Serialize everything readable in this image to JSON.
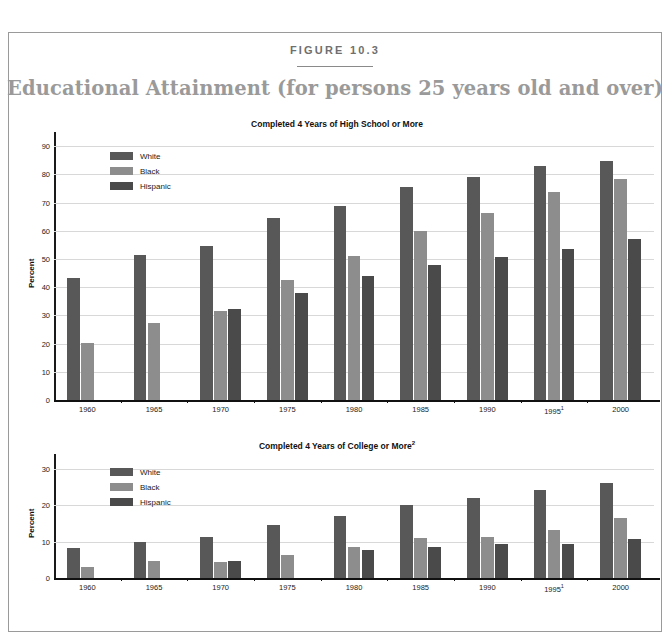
{
  "figure": {
    "label": "FIGURE 10.3",
    "title": "Educational Attainment (for persons 25 years old and over)",
    "title_color": "#9a9a9a"
  },
  "series_colors": {
    "White": "#585858",
    "Black": "#8d8d8d",
    "Hispanic": "#4a4a4a"
  },
  "legend": {
    "items": [
      {
        "label": "White",
        "color": "#585858"
      },
      {
        "label": "Black",
        "color": "#8d8d8d"
      },
      {
        "label": "Hispanic",
        "color": "#4a4a4a"
      }
    ]
  },
  "chart_data": [
    {
      "type": "bar",
      "title": "Completed 4 Years of High School or More",
      "title_sup": "",
      "xlabel": "",
      "ylabel": "Percent",
      "ylim": [
        0,
        95
      ],
      "yticks": [
        0,
        10,
        20,
        30,
        40,
        50,
        60,
        70,
        80,
        90
      ],
      "grid": true,
      "legend_position": "top-left-inside",
      "categories": [
        "1960",
        "1965",
        "1970",
        "1975",
        "1980",
        "1985",
        "1990",
        "1995",
        "2000"
      ],
      "category_sups": [
        "",
        "",
        "",
        "",
        "",
        "",
        "",
        "1",
        ""
      ],
      "series": [
        {
          "name": "White",
          "values": [
            43.2,
            51.3,
            54.5,
            64.5,
            68.8,
            75.5,
            79.1,
            83.0,
            84.9
          ]
        },
        {
          "name": "Black",
          "values": [
            20.1,
            27.2,
            31.4,
            42.5,
            51.2,
            59.8,
            66.2,
            73.8,
            78.5
          ]
        },
        {
          "name": "Hispanic",
          "values": [
            null,
            null,
            32.1,
            37.9,
            44.0,
            47.9,
            50.8,
            53.4,
            57.0
          ]
        }
      ]
    },
    {
      "type": "bar",
      "title": "Completed 4 Years of College or More",
      "title_sup": "2",
      "xlabel": "",
      "ylabel": "Percent",
      "ylim": [
        0,
        34
      ],
      "yticks": [
        0,
        10,
        20,
        30
      ],
      "grid": true,
      "legend_position": "top-left-inside",
      "categories": [
        "1960",
        "1965",
        "1970",
        "1975",
        "1980",
        "1985",
        "1990",
        "1995",
        "2000"
      ],
      "category_sups": [
        "",
        "",
        "",
        "",
        "",
        "",
        "",
        "1",
        ""
      ],
      "series": [
        {
          "name": "White",
          "values": [
            8.1,
            9.9,
            11.3,
            14.5,
            17.1,
            20.0,
            22.0,
            24.0,
            26.1
          ]
        },
        {
          "name": "Black",
          "values": [
            3.1,
            4.7,
            4.4,
            6.4,
            8.4,
            11.1,
            11.3,
            13.2,
            16.5
          ]
        },
        {
          "name": "Hispanic",
          "values": [
            null,
            null,
            4.6,
            null,
            7.6,
            8.5,
            9.2,
            9.3,
            10.6
          ]
        }
      ]
    }
  ]
}
